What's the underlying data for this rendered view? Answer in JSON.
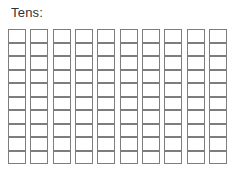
{
  "page": {
    "title": "Tens:",
    "background_color": "#ffffff"
  },
  "worksheet": {
    "label": "Tens:",
    "label_color": "#333333",
    "grid": {
      "columns": 10,
      "rows_per_column": 10,
      "total_cells": 100,
      "cell_fill": "#ffffff",
      "cell_border_color": "#7d7d7d",
      "cell_state": "empty"
    },
    "rods": [
      {
        "name": "rod-1",
        "cells": 10,
        "filled": 0
      },
      {
        "name": "rod-2",
        "cells": 10,
        "filled": 0
      },
      {
        "name": "rod-3",
        "cells": 10,
        "filled": 0
      },
      {
        "name": "rod-4",
        "cells": 10,
        "filled": 0
      },
      {
        "name": "rod-5",
        "cells": 10,
        "filled": 0
      },
      {
        "name": "rod-6",
        "cells": 10,
        "filled": 0
      },
      {
        "name": "rod-7",
        "cells": 10,
        "filled": 0
      },
      {
        "name": "rod-8",
        "cells": 10,
        "filled": 0
      },
      {
        "name": "rod-9",
        "cells": 10,
        "filled": 0
      },
      {
        "name": "rod-10",
        "cells": 10,
        "filled": 0
      }
    ]
  }
}
